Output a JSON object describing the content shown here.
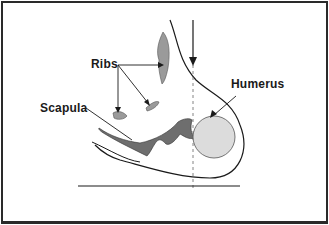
{
  "diagram": {
    "type": "anatomical-cross-section",
    "labels": {
      "ribs": "Ribs",
      "scapula": "Scapula",
      "humerus": "Humerus"
    },
    "colors": {
      "bone_dark": "#6e6e6e",
      "bone_light": "#dcdcdc",
      "outline": "#1a1a1a",
      "rib": "#9a9a9a"
    }
  }
}
